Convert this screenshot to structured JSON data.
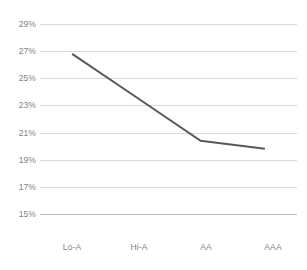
{
  "chart_data": {
    "type": "line",
    "title": "",
    "subtitle": "",
    "xlabel": "",
    "ylabel": "",
    "categories": [
      "Lo-A",
      "Hi-A",
      "AA",
      "AAA"
    ],
    "series": [
      {
        "name": "",
        "values": [
          26.8,
          23.6,
          20.4,
          19.8
        ],
        "color": "#595959"
      }
    ],
    "ylim": [
      15,
      29
    ],
    "ytick_values": [
      29,
      27,
      25,
      23,
      21,
      19,
      17,
      15
    ],
    "ytick_labels": [
      "29%",
      "27%",
      "25%",
      "23%",
      "21%",
      "19%",
      "17%",
      "15%"
    ],
    "grid": true,
    "grid_color": "#d9d9d9",
    "axis_color": "#bfbfbf",
    "label_color": "#7f7f7f",
    "legend": false,
    "legend_position": "none",
    "markers": false,
    "background": "#ffffff"
  }
}
